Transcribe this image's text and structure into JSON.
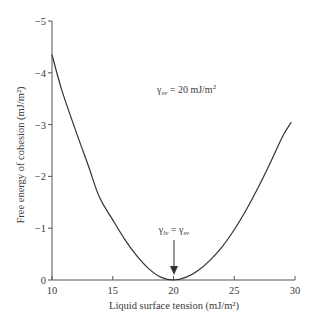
{
  "chart_data": {
    "type": "line",
    "title": "",
    "xlabel": "Liquid surface tension (mJ/m²)",
    "ylabel": "Free energy of cohesion (mJ/m²)",
    "xlim": [
      10,
      30
    ],
    "ylim": [
      0,
      -5
    ],
    "grid": false,
    "x_ticks": [
      10,
      15,
      20,
      25,
      30
    ],
    "x_tick_labels": [
      "10",
      "15",
      "20",
      "25",
      "30"
    ],
    "y_ticks": [
      0,
      -1,
      -2,
      -3,
      -4,
      -5
    ],
    "y_tick_labels": [
      "0",
      "−1",
      "−2",
      "−3",
      "−4",
      "−5"
    ],
    "series": [
      {
        "name": "Free energy of cohesion",
        "x": [
          10,
          10.8,
          12,
          13,
          13.9,
          15,
          16,
          17,
          18,
          19,
          20,
          21,
          22,
          23,
          24,
          25,
          26,
          27,
          28,
          29,
          29.7
        ],
        "y": [
          -4.35,
          -3.67,
          -2.85,
          -2.2,
          -1.6,
          -1.16,
          -0.78,
          -0.46,
          -0.21,
          -0.05,
          0,
          -0.05,
          -0.18,
          -0.38,
          -0.64,
          -0.97,
          -1.36,
          -1.8,
          -2.28,
          -2.78,
          -3.05
        ]
      }
    ],
    "annotations": [
      {
        "id": "gamma-sv-note",
        "symbol": "γ",
        "subscript": "sv",
        "text": " = 20 mJ/m",
        "superscript": "2"
      },
      {
        "id": "minimum-note",
        "symbol_left": "γ",
        "subscript_left": "lv",
        "equals": " = ",
        "symbol_right": "γ",
        "subscript_right": "sv",
        "points_to": {
          "x": 20,
          "y": 0
        }
      }
    ]
  }
}
